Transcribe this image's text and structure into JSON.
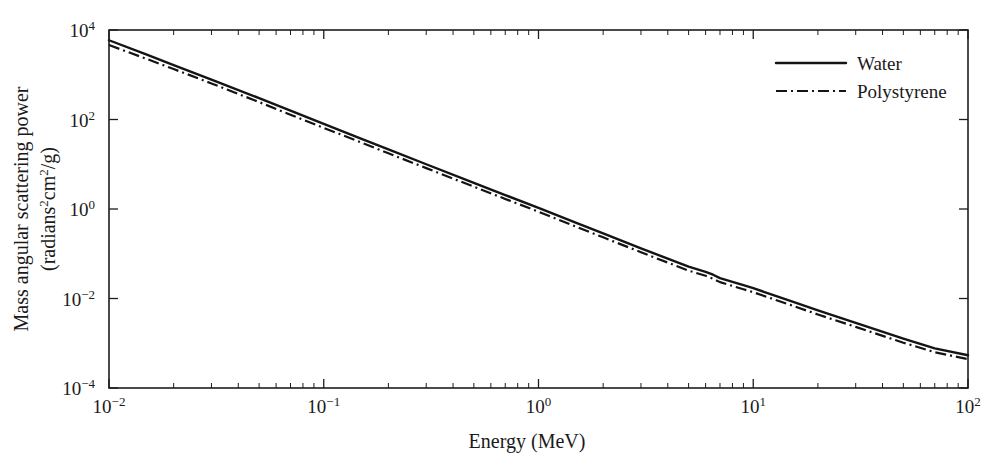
{
  "chart_data": {
    "type": "line",
    "title": "",
    "xlabel": "Energy (MeV)",
    "ylabel_line1": "Mass angular scattering power",
    "ylabel_line2": "(radians2cm2/g)",
    "ylabel_full": "Mass angular scattering power (radians²cm²/g)",
    "xscale": "log",
    "yscale": "log",
    "xlim": [
      0.01,
      100
    ],
    "ylim": [
      0.0001,
      10000
    ],
    "grid": false,
    "legend_position": "top-right",
    "xticks": [
      {
        "value": 0.01,
        "mantissa": "10",
        "exponent": "-2"
      },
      {
        "value": 0.1,
        "mantissa": "10",
        "exponent": "-1"
      },
      {
        "value": 1,
        "mantissa": "10",
        "exponent": "0"
      },
      {
        "value": 10,
        "mantissa": "10",
        "exponent": "1"
      },
      {
        "value": 100,
        "mantissa": "10",
        "exponent": "2"
      }
    ],
    "yticks": [
      {
        "value": 0.0001,
        "mantissa": "10",
        "exponent": "-4"
      },
      {
        "value": 0.01,
        "mantissa": "10",
        "exponent": "-2"
      },
      {
        "value": 1,
        "mantissa": "10",
        "exponent": "0"
      },
      {
        "value": 100,
        "mantissa": "10",
        "exponent": "2"
      },
      {
        "value": 10000,
        "mantissa": "10",
        "exponent": "4"
      }
    ],
    "x": [
      0.01,
      0.015,
      0.02,
      0.03,
      0.05,
      0.07,
      0.1,
      0.15,
      0.2,
      0.3,
      0.5,
      0.7,
      1.0,
      1.5,
      2.0,
      3.0,
      5.0,
      6.0,
      6.5,
      7.0,
      8.0,
      9.0,
      10.0,
      15.0,
      20.0,
      30.0,
      50.0,
      70.0,
      100.0
    ],
    "series": [
      {
        "name": "Water",
        "style": "solid",
        "values": [
          5900,
          2800,
          1650,
          780,
          300,
          158,
          80,
          37,
          21.5,
          10.0,
          3.85,
          2.05,
          1.06,
          0.49,
          0.285,
          0.132,
          0.0515,
          0.0395,
          0.034,
          0.0285,
          0.0235,
          0.0198,
          0.017,
          0.0087,
          0.0054,
          0.00285,
          0.00127,
          0.00077,
          0.00054
        ]
      },
      {
        "name": "Polystyrene",
        "style": "dash-dot",
        "values": [
          4600,
          2250,
          1340,
          640,
          245,
          128,
          65,
          30.5,
          17.6,
          8.2,
          3.15,
          1.68,
          0.87,
          0.4,
          0.233,
          0.108,
          0.042,
          0.0322,
          0.0277,
          0.0232,
          0.0191,
          0.0161,
          0.0138,
          0.0071,
          0.0044,
          0.00232,
          0.00103,
          0.00063,
          0.00044
        ]
      }
    ],
    "annotations": [
      {
        "label": "slope-kink",
        "x_range": [
          6.0,
          9.0
        ],
        "note": "brief steepening of both curves near 6-9 MeV"
      }
    ]
  },
  "legend": {
    "entries": [
      {
        "label": "Water",
        "style": "solid"
      },
      {
        "label": "Polystyrene",
        "style": "dash-dot"
      }
    ]
  }
}
